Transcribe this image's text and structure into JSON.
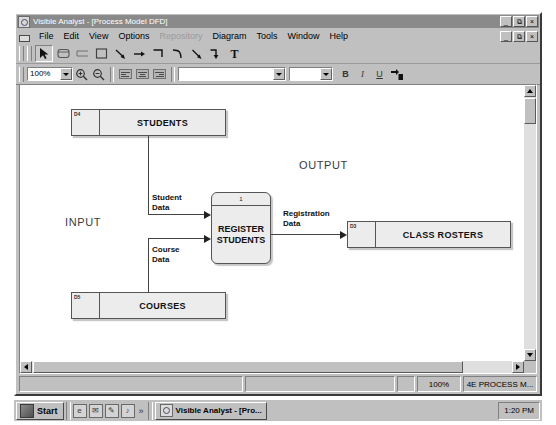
{
  "window": {
    "title": "Visible Analyst - [Process Model DFD]",
    "app_icon": "app-icon",
    "minimize_glyph": "_",
    "restore_glyph": "⧉",
    "close_glyph": "×",
    "doc_minimize_glyph": "_",
    "doc_restore_glyph": "⧉",
    "doc_close_glyph": "×"
  },
  "menu": {
    "items": [
      {
        "label": "File",
        "disabled": false
      },
      {
        "label": "Edit",
        "disabled": false
      },
      {
        "label": "View",
        "disabled": false
      },
      {
        "label": "Options",
        "disabled": false
      },
      {
        "label": "Repository",
        "disabled": true
      },
      {
        "label": "Diagram",
        "disabled": false
      },
      {
        "label": "Tools",
        "disabled": false
      },
      {
        "label": "Window",
        "disabled": false
      },
      {
        "label": "Help",
        "disabled": false
      }
    ]
  },
  "toolbar_tools": [
    {
      "name": "select-pointer-tool",
      "icon": "pointer-icon",
      "pressed": true
    },
    {
      "name": "process-tool",
      "icon": "rounded-rect-icon",
      "pressed": false
    },
    {
      "name": "data-store-tool",
      "icon": "open-rect-icon",
      "pressed": false
    },
    {
      "name": "external-entity-tool",
      "icon": "square-icon",
      "pressed": false
    },
    {
      "name": "diagonal-flow-tool",
      "icon": "diagonal-arrow-icon",
      "pressed": false
    },
    {
      "name": "straight-flow-tool",
      "icon": "right-arrow-icon",
      "pressed": false
    },
    {
      "name": "elbow-flow-tool",
      "icon": "elbow-arrow-icon",
      "pressed": false
    },
    {
      "name": "curve-flow-tool",
      "icon": "curve-arrow-icon",
      "pressed": false
    },
    {
      "name": "angled-flow-tool",
      "icon": "angled-arrow-icon",
      "pressed": false
    },
    {
      "name": "bent-flow-tool",
      "icon": "bent-arrow-icon",
      "pressed": false
    },
    {
      "name": "text-tool",
      "icon": "text-T-icon",
      "pressed": false
    }
  ],
  "format_toolbar": {
    "zoom_value": "100%",
    "zoom_in_icon": "zoom-in-icon",
    "zoom_out_icon": "zoom-out-icon",
    "align_left_icon": "align-left-icon",
    "align_center_icon": "align-center-icon",
    "align_right_icon": "align-right-icon",
    "font_value": "",
    "font_size_value": "",
    "bold_label": "B",
    "italic_label": "I",
    "underline_label": "U",
    "repaint_icon": "repaint-icon"
  },
  "diagram": {
    "annotations": [
      {
        "name": "input-annotation",
        "text": "INPUT",
        "x": 58,
        "y": 196
      },
      {
        "name": "output-annotation",
        "text": "OUTPUT",
        "x": 292,
        "y": 139
      }
    ],
    "data_stores": [
      {
        "name": "data-store-students",
        "id": "D4",
        "label": "STUDENTS",
        "x": 64,
        "y": 89,
        "w": 155,
        "h": 28
      },
      {
        "name": "data-store-courses",
        "id": "D5",
        "label": "COURSES",
        "x": 64,
        "y": 272,
        "w": 155,
        "h": 28
      },
      {
        "name": "data-store-class-rosters",
        "id": "D3",
        "label": "CLASS ROSTERS",
        "x": 340,
        "y": 201,
        "w": 164,
        "h": 28
      }
    ],
    "processes": [
      {
        "name": "process-register-students",
        "number": "1",
        "label": "REGISTER\nSTUDENTS",
        "x": 204,
        "y": 172,
        "w": 60,
        "h": 72
      }
    ],
    "flows": [
      {
        "name": "flow-student-data",
        "label": "Student\nData",
        "lx": 138,
        "ly": 174
      },
      {
        "name": "flow-course-data",
        "label": "Course\nData",
        "lx": 138,
        "ly": 228
      },
      {
        "name": "flow-registration-data",
        "label": "Registration\nData",
        "lx": 276,
        "ly": 190
      }
    ]
  },
  "statusbar": {
    "message": "",
    "pane2": "",
    "zoom": "100%",
    "diagram_name": "4E PROCESS M..."
  },
  "taskbar": {
    "start_label": "Start",
    "quick_launch": [
      {
        "name": "quicklaunch-browser-icon",
        "glyph": "e"
      },
      {
        "name": "quicklaunch-mail-icon",
        "glyph": "✉"
      },
      {
        "name": "quicklaunch-editor-icon",
        "glyph": "✎"
      },
      {
        "name": "quicklaunch-media-icon",
        "glyph": "♪"
      }
    ],
    "overflow_glyph": "»",
    "task_label": "Visible Analyst - [Pro...",
    "clock": "1:20 PM"
  }
}
